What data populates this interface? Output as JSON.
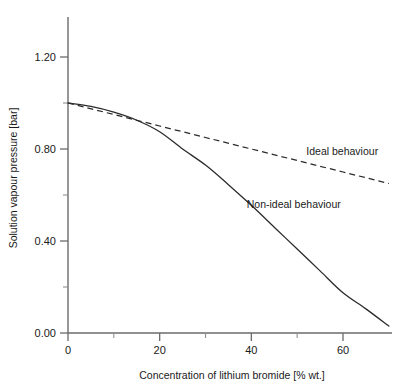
{
  "chart_data": {
    "type": "line",
    "title": "",
    "subtitle": "",
    "xlabel": "Concentration of lithium bromide [% wt.]",
    "ylabel": "Solution vapour pressure [bar]",
    "xlim": [
      0,
      70
    ],
    "ylim": [
      0.0,
      1.3
    ],
    "grid": false,
    "legend_position": "inline-annotations",
    "x_ticks_major": [
      0,
      20,
      40,
      60
    ],
    "x_ticks_major_labels": [
      "0",
      "20",
      "40",
      "60"
    ],
    "x_ticks_minor": [
      10,
      30,
      50
    ],
    "y_ticks_major": [
      0.0,
      0.4,
      0.8,
      1.2
    ],
    "y_ticks_major_labels": [
      "0.00",
      "0.40",
      "0.80",
      "1.20"
    ],
    "y_ticks_minor": [
      0.2,
      0.6,
      1.0
    ],
    "series": [
      {
        "name": "Ideal behaviour",
        "style": "dashed",
        "color": "#2b2b2b",
        "x": [
          0,
          10,
          20,
          30,
          40,
          50,
          60,
          70
        ],
        "values": [
          1.0,
          0.95,
          0.9,
          0.85,
          0.8,
          0.75,
          0.7,
          0.65
        ]
      },
      {
        "name": "Non-ideal behaviour",
        "style": "solid",
        "color": "#2b2b2b",
        "x": [
          0,
          5,
          10,
          15,
          20,
          25,
          30,
          35,
          40,
          45,
          50,
          55,
          60,
          65,
          70
        ],
        "values": [
          1.0,
          0.985,
          0.96,
          0.925,
          0.875,
          0.8,
          0.73,
          0.645,
          0.555,
          0.46,
          0.365,
          0.27,
          0.175,
          0.105,
          0.03
        ]
      }
    ],
    "annotations": [
      {
        "text": "Ideal behaviour",
        "x": 52,
        "y": 0.775
      },
      {
        "text": "Non-ideal behaviour",
        "x": 39,
        "y": 0.545
      }
    ]
  },
  "colors": {
    "axis": "#6b6b6b",
    "curve": "#2b2b2b",
    "text": "#1a1a1a",
    "background": "#ffffff"
  }
}
